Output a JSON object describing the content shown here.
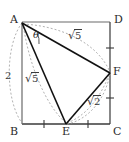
{
  "figure": {
    "width": 129,
    "height": 142,
    "background": "#ffffff",
    "solid_color": "#1a1a1a",
    "dashed_color": "#9a9a9a",
    "square_color": "#555555"
  },
  "vertices": {
    "A": {
      "label": "A",
      "x": 22,
      "y": 22
    },
    "D": {
      "label": "D",
      "x": 110,
      "y": 22
    },
    "B": {
      "label": "B",
      "x": 22,
      "y": 124
    },
    "C": {
      "label": "C",
      "x": 110,
      "y": 124
    },
    "E": {
      "label": "E",
      "x": 66,
      "y": 124
    },
    "F": {
      "label": "F",
      "x": 110,
      "y": 73
    }
  },
  "measures": {
    "side_AB": {
      "text": "2",
      "radical": false
    },
    "AE": {
      "text": "5",
      "radical": true,
      "prefix": "√"
    },
    "AF": {
      "text": "5",
      "radical": true,
      "prefix": "√"
    },
    "EF": {
      "text": "2",
      "radical": true,
      "prefix": "√"
    }
  },
  "angle": {
    "label": "θ",
    "at_vertex": "A",
    "between": [
      "AE",
      "AF"
    ]
  },
  "segments": {
    "solid": [
      "A-E",
      "A-F",
      "E-F"
    ],
    "square": [
      "A-D",
      "D-C",
      "C-B",
      "B-A"
    ],
    "dashed_arcs": [
      "arc-A-to-B",
      "arc-A-to-E",
      "arc-A-to-F",
      "arc-E-to-F",
      "arc-F-to-E-inner"
    ]
  },
  "tickmarks": {
    "count": 4,
    "on": [
      "B-E",
      "E-C",
      "C-F",
      "F-D"
    ]
  }
}
